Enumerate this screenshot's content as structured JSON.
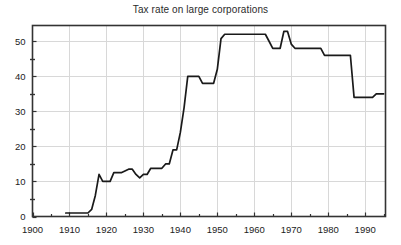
{
  "chart_data": {
    "type": "line",
    "title": "Tax rate on large corporations",
    "xlabel": "",
    "ylabel": "",
    "xlim": [
      1900,
      1995.5
    ],
    "ylim": [
      0,
      54.5
    ],
    "grid": true,
    "legend": "none",
    "x_ticks_major": [
      1900,
      1910,
      1920,
      1930,
      1940,
      1950,
      1960,
      1970,
      1980,
      1990
    ],
    "x_tick_labels": [
      "1900",
      "1910",
      "1920",
      "1930",
      "1940",
      "1950",
      "1960",
      "1970",
      "1980",
      "1990"
    ],
    "x_ticks_minor": [
      1905,
      1915,
      1925,
      1935,
      1945,
      1955,
      1965,
      1975,
      1985,
      1995
    ],
    "y_ticks_major": [
      0,
      10,
      20,
      30,
      40,
      50
    ],
    "y_tick_labels": [
      "0",
      "10",
      "20",
      "30",
      "40",
      "50"
    ],
    "y_ticks_minor": [
      5,
      15,
      25,
      35,
      45
    ],
    "series": [
      {
        "name": "Tax rate on large corporations",
        "color": "#1a1a1a",
        "x": [
          1909,
          1910,
          1911,
          1912,
          1913,
          1914,
          1915,
          1916,
          1917,
          1918,
          1919,
          1920,
          1921,
          1922,
          1923,
          1924,
          1925,
          1926,
          1927,
          1928,
          1929,
          1930,
          1931,
          1932,
          1933,
          1934,
          1935,
          1936,
          1937,
          1938,
          1939,
          1940,
          1941,
          1942,
          1943,
          1944,
          1945,
          1946,
          1947,
          1948,
          1949,
          1950,
          1951,
          1952,
          1953,
          1954,
          1955,
          1956,
          1957,
          1958,
          1959,
          1960,
          1961,
          1962,
          1963,
          1964,
          1965,
          1966,
          1967,
          1968,
          1969,
          1970,
          1971,
          1972,
          1973,
          1974,
          1975,
          1976,
          1977,
          1978,
          1979,
          1980,
          1981,
          1982,
          1983,
          1984,
          1985,
          1986,
          1987,
          1988,
          1989,
          1990,
          1991,
          1992,
          1993,
          1994,
          1995
        ],
        "y": [
          1.0,
          1.0,
          1.0,
          1.0,
          1.0,
          1.0,
          1.0,
          2.0,
          6.0,
          12.0,
          10.0,
          10.0,
          10.0,
          12.5,
          12.5,
          12.5,
          13.0,
          13.5,
          13.5,
          12.0,
          11.0,
          12.0,
          12.0,
          13.75,
          13.75,
          13.75,
          13.75,
          15.0,
          15.0,
          19.0,
          19.0,
          24.0,
          31.0,
          40.0,
          40.0,
          40.0,
          40.0,
          38.0,
          38.0,
          38.0,
          38.0,
          42.0,
          50.75,
          52.0,
          52.0,
          52.0,
          52.0,
          52.0,
          52.0,
          52.0,
          52.0,
          52.0,
          52.0,
          52.0,
          52.0,
          50.0,
          48.0,
          48.0,
          48.0,
          52.8,
          52.8,
          49.2,
          48.0,
          48.0,
          48.0,
          48.0,
          48.0,
          48.0,
          48.0,
          48.0,
          46.0,
          46.0,
          46.0,
          46.0,
          46.0,
          46.0,
          46.0,
          46.0,
          34.0,
          34.0,
          34.0,
          34.0,
          34.0,
          34.0,
          35.0,
          35.0,
          35.0
        ]
      }
    ]
  },
  "axes": {
    "frame_color": "#333333",
    "grid_color": "#d8d8d8"
  }
}
